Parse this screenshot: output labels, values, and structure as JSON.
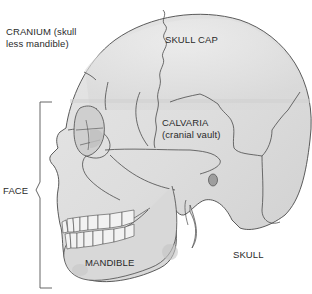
{
  "diagram": {
    "labels": {
      "cranium_line1": "CRANIUM (skull",
      "cranium_line2": "less mandible)",
      "skull_cap": "SKULL CAP",
      "calvaria_line1": "CALVARIA",
      "calvaria_line2": "(cranial vault)",
      "face": "FACE",
      "mandible": "MANDIBLE",
      "skull": "SKULL"
    },
    "colors": {
      "bone_fill": "#dcdcdc",
      "bone_highlight": "#eeeeee",
      "bone_shadow": "#bdbdbd",
      "outline": "#4a4a4a",
      "bracket": "#555555",
      "text": "#2a2a2a",
      "background": "#ffffff"
    }
  }
}
